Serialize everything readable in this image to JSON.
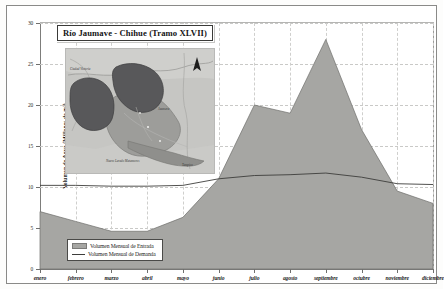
{
  "chart_data": {
    "type": "area",
    "title": "Río Jaumave - Chihue (Tramo XLVII)",
    "xlabel": "",
    "ylabel": "Volumen de Agua (Millones de m³)",
    "ylim": [
      0,
      30
    ],
    "yticks": [
      0,
      5,
      10,
      15,
      20,
      25,
      30
    ],
    "grid": true,
    "legend_position": "bottom-left",
    "categories": [
      "enero",
      "febrero",
      "marzo",
      "abril",
      "mayo",
      "junio",
      "julio",
      "agosto",
      "septiembre",
      "octubre",
      "noviembre",
      "diciembre"
    ],
    "series": [
      {
        "name": "Volumen Mensual de Entrada",
        "style": "filled-area",
        "color": "#a6a6a3",
        "values": [
          7.0,
          5.8,
          4.6,
          4.6,
          6.3,
          11.0,
          20.0,
          19.0,
          28.0,
          17.0,
          9.5,
          8.0
        ]
      },
      {
        "name": "Volumen Mensual de Demanda",
        "style": "line",
        "color": "#3d3d3b",
        "values": [
          10.2,
          10.2,
          10.1,
          10.1,
          10.2,
          11.0,
          11.4,
          11.5,
          11.7,
          11.2,
          10.4,
          10.3
        ]
      }
    ]
  },
  "inset_map": {
    "name": "mapa-cuenca",
    "north_arrow_label": "N",
    "labels": [
      {
        "text": "Ciudad Victoria",
        "x": 10,
        "y": 20
      },
      {
        "text": "Jaumave",
        "x": 96,
        "y": 60
      },
      {
        "text": "Nuevo Laredo Matamoros",
        "x": 44,
        "y": 112
      },
      {
        "text": "Tampico",
        "x": 118,
        "y": 116
      }
    ]
  },
  "legend": {
    "entrada_label": "Volumen Mensual de Entrada",
    "demanda_label": "Volumen Mensual de Demanda"
  },
  "colors": {
    "area_fill": "#a6a6a3",
    "area_edge": "#6e6e6c",
    "demand_line": "#3d3d3b",
    "axis": "#7d7d7b",
    "grid": "#c9c9c7",
    "page_background": "#ffffff"
  }
}
